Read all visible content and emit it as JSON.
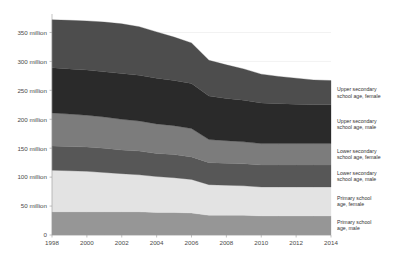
{
  "chart_data": {
    "type": "area",
    "stacked": true,
    "title": "",
    "subtitle": "",
    "xlabel": "",
    "ylabel": "",
    "x": [
      1998,
      1999,
      2000,
      2001,
      2002,
      2003,
      2004,
      2005,
      2006,
      2007,
      2008,
      2009,
      2010,
      2011,
      2012,
      2013,
      2014
    ],
    "xtick_labels": [
      "1998",
      "2000",
      "2002",
      "2004",
      "2006",
      "2008",
      "2010",
      "2012",
      "2014"
    ],
    "xtick_values": [
      1998,
      2000,
      2002,
      2004,
      2006,
      2008,
      2010,
      2012,
      2014
    ],
    "xlim": [
      1998,
      2014
    ],
    "ylim": [
      0,
      375
    ],
    "ytick_labels": [
      "0",
      "50 million",
      "100 million",
      "150 million",
      "200 million",
      "250 million",
      "300 million",
      "350 million"
    ],
    "ytick_values": [
      0,
      50,
      100,
      150,
      200,
      250,
      300,
      350
    ],
    "grid": true,
    "legend_position": "right",
    "units": "million",
    "series": [
      {
        "name": "Primary school age, male",
        "color": "#969696",
        "values": [
          40,
          40,
          40,
          40,
          40,
          40,
          39,
          39,
          38,
          34,
          34,
          34,
          33,
          33,
          33,
          33,
          33
        ]
      },
      {
        "name": "Primary school age, female",
        "color": "#e3e3e3",
        "values": [
          72,
          71,
          70,
          68,
          66,
          64,
          62,
          60,
          58,
          53,
          52,
          51,
          50,
          50,
          50,
          50,
          50
        ]
      },
      {
        "name": "Lower secondary school age, male",
        "color": "#575757",
        "values": [
          42,
          42,
          42,
          42,
          41,
          41,
          40,
          40,
          39,
          38,
          38,
          38,
          38,
          38,
          38,
          38,
          38
        ]
      },
      {
        "name": "Lower secondary school age, female",
        "color": "#7c7c7c",
        "values": [
          57,
          56,
          55,
          54,
          53,
          52,
          51,
          50,
          49,
          40,
          39,
          38,
          37,
          37,
          37,
          37,
          37
        ]
      },
      {
        "name": "Upper secondary school age, male",
        "color": "#2a2a2a",
        "values": [
          78,
          78,
          78,
          78,
          79,
          79,
          79,
          78,
          78,
          75,
          73,
          72,
          70,
          69,
          68,
          67,
          67
        ]
      },
      {
        "name": "Upper secondary school age, female",
        "color": "#4d4d4d",
        "values": [
          83,
          84,
          85,
          86,
          86,
          84,
          80,
          75,
          70,
          62,
          58,
          54,
          50,
          47,
          45,
          43,
          42
        ]
      }
    ],
    "totals": [
      372,
      371,
      370,
      368,
      365,
      360,
      351,
      342,
      332,
      302,
      294,
      287,
      278,
      274,
      271,
      268,
      267
    ]
  },
  "legend": {
    "entries": [
      {
        "label_line1": "Upper secondary",
        "label_line2": "school age, female"
      },
      {
        "label_line1": "Upper secondary",
        "label_line2": "school age, male"
      },
      {
        "label_line1": "Lower secondary",
        "label_line2": "school age, female"
      },
      {
        "label_line1": "Lower secondary",
        "label_line2": "school age, male"
      },
      {
        "label_line1": "Primary school",
        "label_line2": "age, female"
      },
      {
        "label_line1": "Primary school",
        "label_line2": "age, male"
      }
    ]
  }
}
